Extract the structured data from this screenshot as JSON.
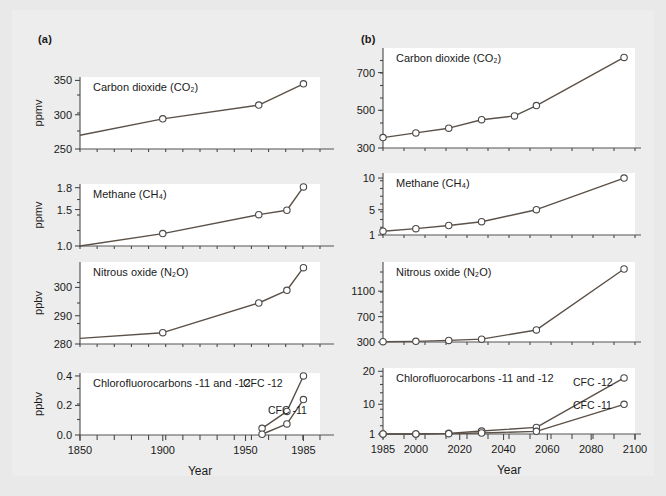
{
  "figure": {
    "panel_a_label": "(a)",
    "panel_b_label": "(b)",
    "xaxis_name": "Year",
    "gases": {
      "co2": "Carbon dioxide (CO₂)",
      "ch4": "Methane (CH₄)",
      "n2o": "Nitrous oxide (N₂O)",
      "cfc": "Chlorofluorocarbons -11 and -12"
    },
    "series_labels": {
      "cfc11": "CFC -11",
      "cfc12": "CFC -12"
    },
    "units": {
      "ppmv": "ppmv",
      "ppbv": "ppbv"
    },
    "colors": {
      "background": "#e9e9e9",
      "plate": "#ededed",
      "plot_area": "#ffffff",
      "line": "#5b5148",
      "axis": "#4a4a4a",
      "text": "#1a1a1a"
    }
  },
  "chart_data": [
    {
      "id": "a-co2",
      "type": "line",
      "panel": "(a)",
      "title": "Carbon dioxide (CO₂)",
      "xlabel": "Year",
      "ylabel": "ppmv",
      "xlim": [
        1850,
        1995
      ],
      "ylim": [
        250,
        355
      ],
      "xticks": [
        1850,
        1900,
        1950,
        1985
      ],
      "xticklabels": [
        "1850",
        "1900",
        "1950",
        "1985"
      ],
      "yticks": [
        250,
        300,
        350
      ],
      "yticklabels": [
        "250",
        "300",
        "350"
      ],
      "yminorticks": [
        275,
        325
      ],
      "grid": false,
      "series": [
        {
          "name": "CO2",
          "x": [
            1850,
            1900,
            1958,
            1985
          ],
          "y": [
            270,
            294,
            314,
            345
          ],
          "markers": [
            false,
            true,
            true,
            true
          ]
        }
      ]
    },
    {
      "id": "a-ch4",
      "type": "line",
      "panel": "(a)",
      "title": "Methane (CH₄)",
      "xlabel": "Year",
      "ylabel": "ppmv",
      "xlim": [
        1850,
        1995
      ],
      "ylim": [
        1.0,
        1.85
      ],
      "xticks": [
        1850,
        1900,
        1950,
        1985
      ],
      "yticks": [
        1.0,
        1.5,
        1.8
      ],
      "yticklabels": [
        "1.0",
        "1.5",
        "1.8"
      ],
      "grid": false,
      "series": [
        {
          "name": "CH4",
          "x": [
            1850,
            1900,
            1958,
            1975,
            1985
          ],
          "y": [
            1.0,
            1.17,
            1.43,
            1.49,
            1.81
          ],
          "markers": [
            false,
            true,
            true,
            true,
            true
          ]
        }
      ]
    },
    {
      "id": "a-n2o",
      "type": "line",
      "panel": "(a)",
      "title": "Nitrous oxide (N₂O)",
      "xlabel": "Year",
      "ylabel": "ppbv",
      "xlim": [
        1850,
        1995
      ],
      "ylim": [
        280,
        309
      ],
      "xticks": [
        1850,
        1900,
        1950,
        1985
      ],
      "yticks": [
        280,
        290,
        300
      ],
      "yticklabels": [
        "280",
        "290",
        "300"
      ],
      "grid": false,
      "series": [
        {
          "name": "N2O",
          "x": [
            1850,
            1900,
            1958,
            1975,
            1985
          ],
          "y": [
            282,
            284,
            294.5,
            299,
            307
          ],
          "markers": [
            false,
            true,
            true,
            true,
            true
          ]
        }
      ]
    },
    {
      "id": "a-cfc",
      "type": "line",
      "panel": "(a)",
      "title": "Chlorofluorocarbons -11 and -12",
      "xlabel": "Year",
      "ylabel": "ppbv",
      "xlim": [
        1850,
        1995
      ],
      "ylim": [
        0.0,
        0.42
      ],
      "xticks": [
        1850,
        1900,
        1950,
        1985
      ],
      "xticklabels": [
        "1850",
        "1900",
        "1950",
        "1985"
      ],
      "yticks": [
        0.0,
        0.2,
        0.4
      ],
      "yticklabels": [
        "0.0",
        "0.2",
        "0.4"
      ],
      "grid": false,
      "series": [
        {
          "name": "CFC -12",
          "x": [
            1960,
            1975,
            1985
          ],
          "y": [
            0.045,
            0.16,
            0.4
          ],
          "markers": [
            true,
            true,
            true
          ]
        },
        {
          "name": "CFC -11",
          "x": [
            1960,
            1975,
            1985
          ],
          "y": [
            0.005,
            0.075,
            0.24
          ],
          "markers": [
            true,
            true,
            true
          ]
        }
      ]
    },
    {
      "id": "b-co2",
      "type": "line",
      "panel": "(b)",
      "title": "Carbon dioxide (CO₂)",
      "xlabel": "Year",
      "ylabel": "",
      "xlim": [
        1985,
        2100
      ],
      "ylim": [
        300,
        830
      ],
      "xticks": [
        1985,
        2000,
        2020,
        2040,
        2060,
        2080,
        2100
      ],
      "yticks": [
        300,
        500,
        700
      ],
      "yticklabels": [
        "300",
        "500",
        "700"
      ],
      "grid": false,
      "series": [
        {
          "name": "CO2",
          "x": [
            1985,
            2000,
            2015,
            2030,
            2045,
            2055,
            2095
          ],
          "y": [
            355,
            380,
            405,
            450,
            470,
            525,
            780
          ],
          "markers": [
            true,
            true,
            true,
            true,
            true,
            true,
            true
          ]
        }
      ]
    },
    {
      "id": "b-ch4",
      "type": "line",
      "panel": "(b)",
      "title": "Methane (CH₄)",
      "xlabel": "Year",
      "ylabel": "",
      "xlim": [
        1985,
        2100
      ],
      "ylim": [
        1,
        10.8
      ],
      "xticks": [
        1985,
        2000,
        2020,
        2040,
        2060,
        2080,
        2100
      ],
      "yticks": [
        1,
        5,
        10
      ],
      "yticklabels": [
        "1",
        "5",
        "10"
      ],
      "grid": false,
      "series": [
        {
          "name": "CH4",
          "x": [
            1985,
            2000,
            2015,
            2030,
            2055,
            2095
          ],
          "y": [
            1.6,
            2.0,
            2.5,
            3.1,
            5.0,
            10.0
          ],
          "markers": [
            true,
            true,
            true,
            true,
            true,
            true
          ]
        }
      ]
    },
    {
      "id": "b-n2o",
      "type": "line",
      "panel": "(b)",
      "title": "Nitrous oxide (N₂O)",
      "xlabel": "",
      "ylabel": "",
      "xlim": [
        1985,
        2100
      ],
      "ylim": [
        300,
        1560
      ],
      "xticks": [
        1985,
        2000,
        2020,
        2040,
        2060,
        2080,
        2100
      ],
      "yticks": [
        300,
        700,
        1100
      ],
      "yticklabels": [
        "300",
        "700",
        "1100"
      ],
      "grid": false,
      "series": [
        {
          "name": "N2O",
          "x": [
            1985,
            2000,
            2015,
            2030,
            2055,
            2095
          ],
          "y": [
            305,
            310,
            325,
            345,
            490,
            1450
          ],
          "markers": [
            true,
            true,
            true,
            true,
            true,
            true
          ]
        }
      ]
    },
    {
      "id": "b-cfc",
      "type": "line",
      "panel": "(b)",
      "title": "Chlorofluorocarbons -11 and -12",
      "xlabel": "Year",
      "ylabel": "",
      "xlim": [
        1985,
        2100
      ],
      "ylim": [
        1,
        21
      ],
      "xticks": [
        1985,
        2000,
        2020,
        2040,
        2060,
        2080,
        2100
      ],
      "xticklabels": [
        "1985",
        "2000",
        "2020",
        "2040",
        "2060",
        "2080",
        "2100"
      ],
      "yticks": [
        1,
        10,
        20
      ],
      "yticklabels": [
        "1",
        "10",
        "20"
      ],
      "grid": false,
      "series": [
        {
          "name": "CFC -12",
          "x": [
            1985,
            2000,
            2015,
            2030,
            2055,
            2095
          ],
          "y": [
            1.0,
            1.0,
            1.2,
            1.9,
            3.0,
            18.0
          ],
          "markers": [
            true,
            true,
            true,
            true,
            true,
            true
          ]
        },
        {
          "name": "CFC -11",
          "x": [
            1985,
            2000,
            2015,
            2030,
            2055,
            2095
          ],
          "y": [
            1.0,
            1.0,
            1.1,
            1.3,
            1.8,
            10.0
          ],
          "markers": [
            true,
            true,
            true,
            true,
            true,
            true
          ]
        }
      ]
    }
  ]
}
